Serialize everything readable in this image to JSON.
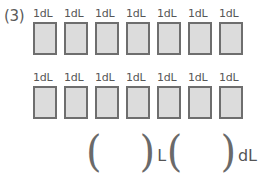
{
  "problem": {
    "number_label": "(3)",
    "box_label": "1dL",
    "rows": [
      {
        "boxes": [
          "1dL",
          "1dL",
          "1dL",
          "1dL",
          "1dL",
          "1dL",
          "1dL"
        ]
      },
      {
        "boxes": [
          "1dL",
          "1dL",
          "1dL",
          "1dL",
          "1dL",
          "1dL",
          "1dL"
        ]
      }
    ],
    "answer_line": {
      "open_paren_1": "(",
      "blank_1_value": "",
      "close_paren_1": ")",
      "unit_1": "L",
      "open_paren_2": "(",
      "blank_2_value": "",
      "close_paren_2": ")",
      "unit_2": "dL"
    }
  },
  "colors": {
    "box_fill": "#dcdcdc",
    "box_border": "#6e6e6e",
    "text": "#555555",
    "background": "#ffffff"
  }
}
